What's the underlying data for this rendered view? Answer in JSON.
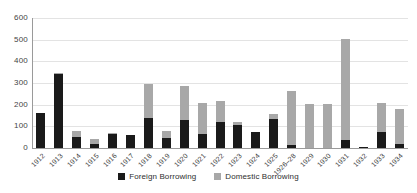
{
  "chart_data": {
    "type": "bar",
    "subtype": "stacked-vertical",
    "title": "",
    "xlabel": "",
    "ylabel": "",
    "ylim": [
      0,
      600
    ],
    "yticks": [
      0,
      100,
      200,
      300,
      400,
      500,
      600
    ],
    "grid": true,
    "legend_position": "bottom-center",
    "categories": [
      "1912",
      "1913",
      "1914",
      "1915",
      "1916",
      "1917",
      "1918",
      "1919",
      "1920",
      "1921",
      "1922",
      "1923",
      "1924",
      "1925",
      "1926–28",
      "1929",
      "1930",
      "1931",
      "1932",
      "1933",
      "1934"
    ],
    "series": [
      {
        "name": "Foreign Borrowing",
        "color": "#1a1a1a",
        "values": [
          160,
          340,
          50,
          20,
          65,
          60,
          140,
          45,
          130,
          65,
          120,
          105,
          75,
          135,
          12,
          0,
          0,
          35,
          5,
          75,
          20
        ]
      },
      {
        "name": "Domestic Borrowing",
        "color": "#a8a8a8",
        "values": [
          0,
          8,
          30,
          22,
          2,
          0,
          155,
          35,
          155,
          145,
          95,
          15,
          0,
          20,
          253,
          205,
          205,
          470,
          0,
          135,
          160
        ]
      }
    ],
    "totals": [
      160,
      348,
      80,
      42,
      67,
      60,
      295,
      80,
      285,
      210,
      215,
      120,
      75,
      155,
      265,
      205,
      205,
      505,
      5,
      210,
      180
    ]
  },
  "legend": {
    "entries": [
      {
        "label": "Foreign Borrowing",
        "swatch": "foreign-swatch"
      },
      {
        "label": "Domestic Borrowing",
        "swatch": "domestic-swatch"
      }
    ]
  }
}
